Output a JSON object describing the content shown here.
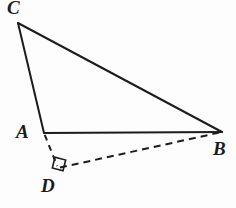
{
  "figure": {
    "background_color": "#fdfdfd",
    "stroke_color": "#1c1c1c",
    "labels": {
      "c": "C",
      "a": "A",
      "b": "B",
      "d": "D"
    },
    "points": {
      "C": {
        "x": 18,
        "y": 23
      },
      "A": {
        "x": 44,
        "y": 133
      },
      "B": {
        "x": 222,
        "y": 132
      },
      "D": {
        "x": 58,
        "y": 168
      }
    },
    "segments": [
      {
        "name": "CA",
        "from": "C",
        "to": "A",
        "style": "solid"
      },
      {
        "name": "CB",
        "from": "C",
        "to": "B",
        "style": "solid"
      },
      {
        "name": "AB",
        "from": "A",
        "to": "B",
        "style": "solid"
      },
      {
        "name": "AD",
        "from": "A",
        "to": "D",
        "style": "dashed"
      },
      {
        "name": "DB",
        "from": "D",
        "to": "B",
        "style": "dashed"
      }
    ],
    "right_angle_marker": {
      "at": "D",
      "center_x": 59,
      "center_y": 164,
      "size": 11,
      "rotation_deg": 14
    }
  }
}
